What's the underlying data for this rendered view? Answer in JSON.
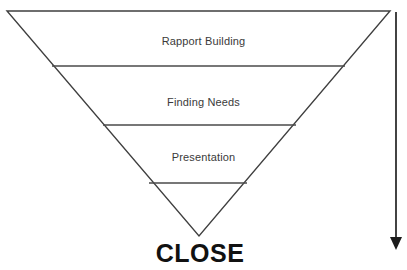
{
  "diagram": {
    "type": "inverted-triangle-funnel",
    "background_color": "#ffffff",
    "line_color": "#3f3f3f",
    "label_color": "#3a3a3a",
    "close_color": "#111111",
    "stages": [
      {
        "id": "rapport-building",
        "label": "Rapport Building"
      },
      {
        "id": "finding-needs",
        "label": "Finding Needs"
      },
      {
        "id": "presentation",
        "label": "Presentation"
      }
    ],
    "outcome": {
      "id": "close",
      "label": "CLOSE"
    },
    "arrow": {
      "id": "downward-progress-arrow",
      "direction": "down"
    },
    "geometry": {
      "triangle": {
        "top_left": [
          7,
          11
        ],
        "top_right": [
          390,
          11
        ],
        "apex": [
          199,
          236
        ]
      },
      "dividers": [
        {
          "y": 66,
          "x1": 52,
          "x2": 345
        },
        {
          "y": 125,
          "x1": 103,
          "x2": 296
        },
        {
          "y": 183,
          "x1": 149,
          "x2": 247
        }
      ],
      "arrow_line": {
        "x": 396,
        "y1": 12,
        "y2": 246
      }
    }
  }
}
